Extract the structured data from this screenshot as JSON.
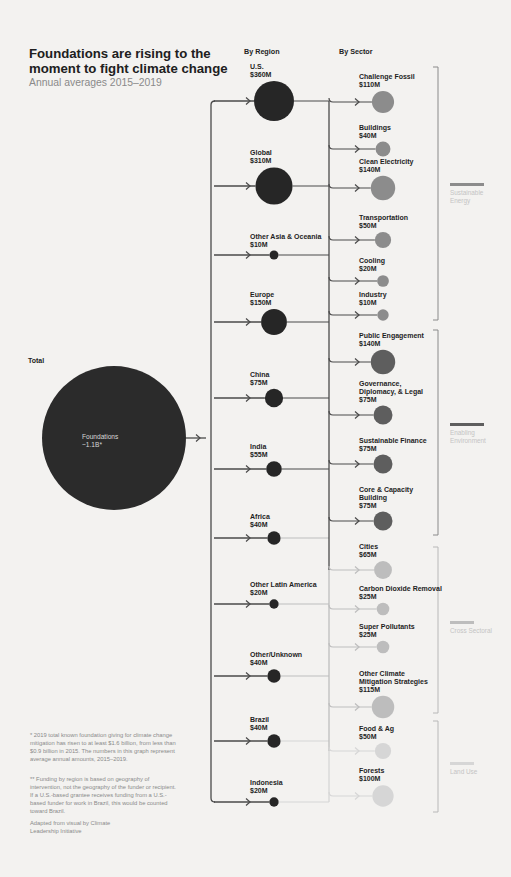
{
  "header": {
    "title": "Foundations are rising to the moment to fight climate change",
    "subtitle": "Annual averages 2015–2019"
  },
  "columns": {
    "total": "Total",
    "region": "By Region",
    "sector": "By Sector"
  },
  "total": {
    "label": "Foundations",
    "value": "~1.1B*"
  },
  "regions": [
    {
      "name": "U.S.",
      "value": "$360M"
    },
    {
      "name": "Global",
      "value": "$310M"
    },
    {
      "name": "Other Asia & Oceania",
      "value": "$10M"
    },
    {
      "name": "Europe",
      "value": "$150M"
    },
    {
      "name": "China",
      "value": "$75M"
    },
    {
      "name": "India",
      "value": "$55M"
    },
    {
      "name": "Africa",
      "value": "$40M"
    },
    {
      "name": "Other Latin America",
      "value": "$20M"
    },
    {
      "name": "Other/Unknown",
      "value": "$40M"
    },
    {
      "name": "Brazil",
      "value": "$40M"
    },
    {
      "name": "Indonesia",
      "value": "$20M"
    }
  ],
  "sectors": [
    {
      "name": "Challenge Fossil",
      "value": "$110M",
      "group": "Sustainable Energy"
    },
    {
      "name": "Buildings",
      "value": "$40M",
      "group": "Sustainable Energy"
    },
    {
      "name": "Clean Electricity",
      "value": "$140M",
      "group": "Sustainable Energy"
    },
    {
      "name": "Transportation",
      "value": "$50M",
      "group": "Sustainable Energy"
    },
    {
      "name": "Cooling",
      "value": "$20M",
      "group": "Sustainable Energy"
    },
    {
      "name": "Industry",
      "value": "$10M",
      "group": "Sustainable Energy"
    },
    {
      "name": "Public Engagement",
      "value": "$140M",
      "group": "Enabling Environment"
    },
    {
      "name": "Governance, Diplomacy, & Legal",
      "value": "$75M",
      "group": "Enabling Environment"
    },
    {
      "name": "Sustainable Finance",
      "value": "$75M",
      "group": "Enabling Environment"
    },
    {
      "name": "Core & Capacity Building",
      "value": "$75M",
      "group": "Enabling Environment"
    },
    {
      "name": "Cities",
      "value": "$65M",
      "group": "Cross Sectoral"
    },
    {
      "name": "Carbon Dioxide Removal",
      "value": "$25M",
      "group": "Cross Sectoral"
    },
    {
      "name": "Super Pollutants",
      "value": "$25M",
      "group": "Cross Sectoral"
    },
    {
      "name": "Other Climate Mitigation Strategies",
      "value": "$115M",
      "group": "Cross Sectoral"
    },
    {
      "name": "Food & Ag",
      "value": "$50M",
      "group": "Land Use"
    },
    {
      "name": "Forests",
      "value": "$100M",
      "group": "Land Use"
    }
  ],
  "legend": [
    {
      "label": "Sustainable Energy",
      "color": "#8c8c8c"
    },
    {
      "label": "Enabling Environment",
      "color": "#5e5e5e"
    },
    {
      "label": "Cross Sectoral",
      "color": "#bdbdbd"
    },
    {
      "label": "Land Use",
      "color": "#d6d6d6"
    }
  ],
  "colors": {
    "background": "#f3f2f0",
    "total_circle": "#2b2b2b",
    "region_circle": "#262626",
    "line_dark": "#4a4a4a"
  },
  "footnotes": [
    "* 2019 total known foundation giving for climate change mitigation has risen to at least $1.6 billion, from less than $0.9 billion in 2015. The numbers in this graph represent average annual amounts, 2015–2019.",
    "** Funding by region is based on geography of intervention, not the geography of the funder or recipient. If a U.S.-based grantee receives funding from a U.S.-based funder for work in Brazil, this would be counted toward Brazil.",
    "Adapted from visual by Climate Leadership Initiative"
  ],
  "chart_data": {
    "type": "flow",
    "title": "Foundations are rising to the moment to fight climate change",
    "subtitle": "Annual averages 2015–2019",
    "total": {
      "label": "Foundations",
      "value_usd_millions": 1100,
      "display": "~1.1B*"
    },
    "by_region": {
      "categories": [
        "U.S.",
        "Global",
        "Other Asia & Oceania",
        "Europe",
        "China",
        "India",
        "Africa",
        "Other Latin America",
        "Other/Unknown",
        "Brazil",
        "Indonesia"
      ],
      "values": [
        360,
        310,
        10,
        150,
        75,
        55,
        40,
        20,
        40,
        40,
        20
      ],
      "unit": "$M"
    },
    "by_sector": {
      "categories": [
        "Challenge Fossil",
        "Buildings",
        "Clean Electricity",
        "Transportation",
        "Cooling",
        "Industry",
        "Public Engagement",
        "Governance, Diplomacy, & Legal",
        "Sustainable Finance",
        "Core & Capacity Building",
        "Cities",
        "Carbon Dioxide Removal",
        "Super Pollutants",
        "Other Climate Mitigation Strategies",
        "Food & Ag",
        "Forests"
      ],
      "values": [
        110,
        40,
        140,
        50,
        20,
        10,
        140,
        75,
        75,
        75,
        65,
        25,
        25,
        115,
        50,
        100
      ],
      "groups": [
        "Sustainable Energy",
        "Sustainable Energy",
        "Sustainable Energy",
        "Sustainable Energy",
        "Sustainable Energy",
        "Sustainable Energy",
        "Enabling Environment",
        "Enabling Environment",
        "Enabling Environment",
        "Enabling Environment",
        "Cross Sectoral",
        "Cross Sectoral",
        "Cross Sectoral",
        "Cross Sectoral",
        "Land Use",
        "Land Use"
      ],
      "unit": "$M"
    }
  }
}
